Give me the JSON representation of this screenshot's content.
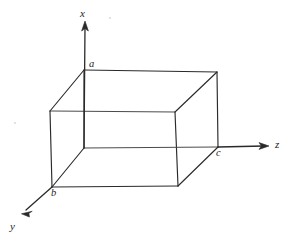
{
  "figure": {
    "kind": "3d-box-axes-diagram",
    "width": 290,
    "height": 238,
    "background_color": "#ffffff",
    "line_color": "#2a2a2a",
    "text_color": "#1d1d1d"
  },
  "axes": [
    {
      "id": "x",
      "label": "x",
      "direction": "up",
      "label_x": 80,
      "label_y": 8,
      "origin_x": 84,
      "origin_y": 148,
      "tip_x": 85,
      "tip_y": 22,
      "has_arrow": true
    },
    {
      "id": "z",
      "label": "z",
      "direction": "right",
      "label_x": 275,
      "label_y": 139,
      "origin_x": 218,
      "origin_y": 147,
      "tip_x": 268,
      "tip_y": 146,
      "has_arrow": true
    },
    {
      "id": "y",
      "label": "y",
      "direction": "down-left",
      "label_x": 10,
      "label_y": 221,
      "origin_x": 52,
      "origin_y": 187,
      "tip_x": 22,
      "tip_y": 213,
      "has_arrow": true
    }
  ],
  "vertices": [
    {
      "id": "a",
      "label": "a",
      "x": 84,
      "y": 70,
      "label_x": 89,
      "label_y": 59,
      "labeled": true,
      "role": "top-back-left"
    },
    {
      "id": "c",
      "label": "c",
      "x": 218,
      "y": 147,
      "label_x": 216,
      "label_y": 148,
      "labeled": true,
      "role": "bottom-back-right"
    },
    {
      "id": "b",
      "label": "b",
      "x": 52,
      "y": 187,
      "label_x": 51,
      "label_y": 188,
      "labeled": true,
      "role": "bottom-front-left"
    },
    {
      "id": "v_top_back_right",
      "label": "",
      "x": 217,
      "y": 72,
      "labeled": false,
      "role": "top-back-right"
    },
    {
      "id": "v_top_front_left",
      "label": "",
      "x": 50,
      "y": 111,
      "labeled": false,
      "role": "top-front-left"
    },
    {
      "id": "v_top_front_right",
      "label": "",
      "x": 175,
      "y": 112,
      "labeled": false,
      "role": "top-front-right"
    },
    {
      "id": "v_bottom_back_left",
      "label": "",
      "x": 84,
      "y": 148,
      "labeled": false,
      "role": "bottom-back-left"
    },
    {
      "id": "v_bottom_front_right",
      "label": "",
      "x": 178,
      "y": 186,
      "labeled": false,
      "role": "bottom-front-right"
    }
  ],
  "edges": [
    {
      "id": "top-back",
      "from": "a",
      "to": "v_top_back_right",
      "x1": 84,
      "y1": 70,
      "x2": 217,
      "y2": 72
    },
    {
      "id": "top-left-diag",
      "from": "a",
      "to": "v_top_front_left",
      "x1": 84,
      "y1": 70,
      "x2": 50,
      "y2": 111
    },
    {
      "id": "top-right-diag",
      "from": "v_top_back_right",
      "to": "v_top_front_right",
      "x1": 217,
      "y1": 72,
      "x2": 175,
      "y2": 112
    },
    {
      "id": "top-front",
      "from": "v_top_front_left",
      "to": "v_top_front_right",
      "x1": 50,
      "y1": 111,
      "x2": 175,
      "y2": 112
    },
    {
      "id": "vert-back-left",
      "from": "a",
      "to": "v_bottom_back_left",
      "x1": 84,
      "y1": 70,
      "x2": 84,
      "y2": 148
    },
    {
      "id": "vert-back-right",
      "from": "v_top_back_right",
      "to": "c",
      "x1": 217,
      "y1": 72,
      "x2": 218,
      "y2": 147
    },
    {
      "id": "vert-front-left",
      "from": "v_top_front_left",
      "to": "b",
      "x1": 50,
      "y1": 111,
      "x2": 52,
      "y2": 187
    },
    {
      "id": "vert-front-right",
      "from": "v_top_front_right",
      "to": "v_bottom_front_right",
      "x1": 175,
      "y1": 112,
      "x2": 178,
      "y2": 186
    },
    {
      "id": "bottom-back",
      "from": "v_bottom_back_left",
      "to": "c",
      "x1": 84,
      "y1": 148,
      "x2": 218,
      "y2": 147
    },
    {
      "id": "bottom-left-diag",
      "from": "v_bottom_back_left",
      "to": "b",
      "x1": 84,
      "y1": 148,
      "x2": 52,
      "y2": 187
    },
    {
      "id": "bottom-right-diag",
      "from": "v_bottom_front_right",
      "to": "c",
      "x1": 178,
      "y1": 186,
      "x2": 218,
      "y2": 147
    },
    {
      "id": "bottom-front",
      "from": "b",
      "to": "v_bottom_front_right",
      "x1": 52,
      "y1": 187,
      "x2": 178,
      "y2": 186
    }
  ]
}
